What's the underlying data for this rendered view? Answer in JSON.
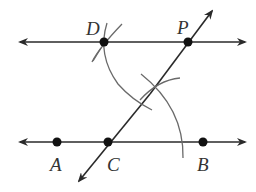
{
  "diagram": {
    "type": "geometric-construction",
    "colors": {
      "line": "#2a2a2a",
      "arc": "#6a6a6a",
      "point": "#111111",
      "label": "#333333"
    },
    "points": {
      "D": {
        "label": "D",
        "x": 104,
        "y": 42
      },
      "P": {
        "label": "P",
        "x": 188,
        "y": 42
      },
      "A": {
        "label": "A",
        "x": 57,
        "y": 142
      },
      "C": {
        "label": "C",
        "x": 108,
        "y": 142
      },
      "B": {
        "label": "B",
        "x": 203,
        "y": 142
      }
    },
    "labels": {
      "D": "D",
      "P": "P",
      "A": "A",
      "C": "C",
      "B": "B"
    }
  }
}
